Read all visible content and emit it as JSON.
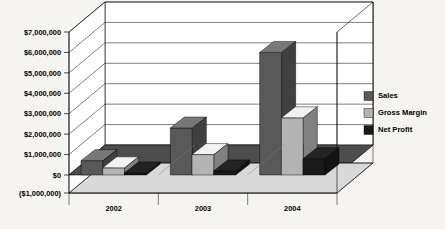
{
  "chart_data": {
    "type": "bar",
    "title": "",
    "subtitle": "",
    "xlabel": "",
    "ylabel": "",
    "categories": [
      "2002",
      "2003",
      "2004"
    ],
    "series": [
      {
        "name": "Sales",
        "values": [
          700000,
          2300000,
          6000000
        ],
        "color": "#595959"
      },
      {
        "name": "Gross Margin",
        "values": [
          350000,
          1000000,
          2800000
        ],
        "color": "#b3b3b3"
      },
      {
        "name": "Net Profit",
        "values": [
          100000,
          200000,
          800000
        ],
        "color": "#1a1a1a"
      }
    ],
    "ylim": [
      -1000000,
      7000000
    ],
    "ytick_values": [
      7000000,
      6000000,
      5000000,
      4000000,
      3000000,
      2000000,
      1000000,
      0,
      -1000000
    ],
    "ytick_labels": [
      "$7,000,000",
      "$6,000,000",
      "$5,000,000",
      "$4,000,000",
      "$3,000,000",
      "$2,000,000",
      "$1,000,000",
      "$0",
      "($1,000,000)"
    ],
    "grid": true,
    "grid_axis": "y",
    "legend_position": "right",
    "three_d": true,
    "plot_background": "#ffffff",
    "floor_color": "#4d4d4d",
    "wall_color": "#ffffff",
    "axis_line_color": "#000000",
    "grid_color": "#000000",
    "background": "#f5f4f0"
  },
  "legend": {
    "entries": [
      {
        "label": "Sales",
        "color": "#595959"
      },
      {
        "label": "Gross Margin",
        "color": "#b3b3b3"
      },
      {
        "label": "Net Profit",
        "color": "#1a1a1a"
      }
    ]
  }
}
